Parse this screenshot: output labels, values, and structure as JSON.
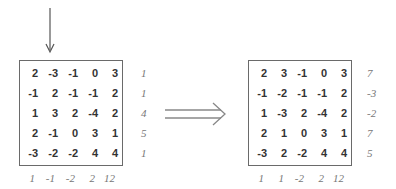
{
  "left": {
    "matrix": [
      [
        2,
        -3,
        -1,
        0,
        3
      ],
      [
        -1,
        2,
        -1,
        -1,
        2
      ],
      [
        1,
        3,
        2,
        -4,
        2
      ],
      [
        2,
        -1,
        0,
        3,
        1
      ],
      [
        -3,
        -2,
        -2,
        4,
        4
      ]
    ],
    "row_sums": [
      "1",
      "1",
      "4",
      "5",
      "1"
    ],
    "col_sums": [
      "1",
      "-1",
      "-2",
      "2",
      "12"
    ],
    "marked_column": 1
  },
  "right": {
    "matrix": [
      [
        2,
        3,
        -1,
        0,
        3
      ],
      [
        -1,
        -2,
        -1,
        -1,
        2
      ],
      [
        1,
        -3,
        2,
        -4,
        2
      ],
      [
        2,
        1,
        0,
        3,
        1
      ],
      [
        -3,
        2,
        -2,
        4,
        4
      ]
    ],
    "row_sums": [
      "7",
      "-3",
      "-2",
      "7",
      "5"
    ],
    "col_sums": [
      "1",
      "1",
      "-2",
      "2",
      "12"
    ]
  },
  "transform_arrow": "double-right-arrow",
  "colors": {
    "border": "#6a6a6a",
    "values": "#333333",
    "sums": "#777777"
  }
}
